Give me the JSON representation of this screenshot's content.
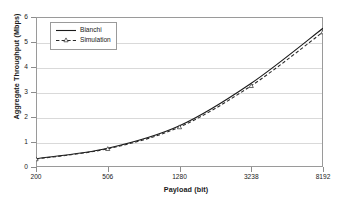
{
  "chart_data": {
    "type": "line",
    "title": "",
    "xlabel": "Payload (bit)",
    "ylabel": "Aggregate Throughput (Mbps)",
    "categories": [
      "200",
      "506",
      "1280",
      "3238",
      "8192"
    ],
    "x": [
      200,
      506,
      1280,
      3238,
      8192
    ],
    "ylim": [
      0,
      6
    ],
    "yticks": [
      "0",
      "1",
      "2",
      "3",
      "4",
      "5",
      "6"
    ],
    "ytick_values": [
      0,
      1,
      2,
      3,
      4,
      5,
      6
    ],
    "grid": "horizontal",
    "legend_position": "upper-left-inside",
    "series": [
      {
        "name": "Bianchi",
        "values": [
          0.33,
          0.75,
          1.65,
          3.35,
          5.55
        ],
        "style": "solid",
        "marker": "none",
        "color": "#1a1a1a"
      },
      {
        "name": "Simulation",
        "values": [
          0.32,
          0.73,
          1.6,
          3.25,
          5.4
        ],
        "style": "dashed",
        "marker": "triangle",
        "color": "#1a1a1a"
      }
    ]
  },
  "legend": {
    "items": [
      {
        "label": "Bianchi"
      },
      {
        "label": "Simulation"
      }
    ]
  }
}
